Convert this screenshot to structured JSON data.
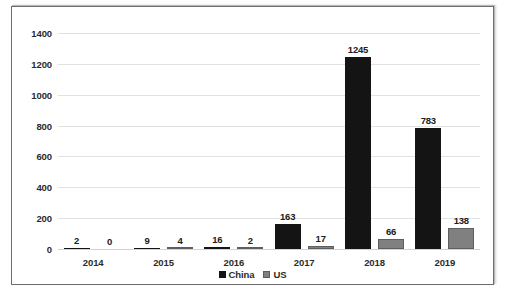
{
  "chart_data": {
    "type": "bar",
    "title": "",
    "subtitle": "",
    "xlabel": "",
    "ylabel": "",
    "categories": [
      "2014",
      "2015",
      "2016",
      "2017",
      "2018",
      "2019"
    ],
    "series": [
      {
        "name": "China",
        "color": "#141414",
        "values": [
          2,
          9,
          16,
          163,
          1245,
          783
        ]
      },
      {
        "name": "US",
        "color": "#808080",
        "values": [
          0,
          4,
          2,
          17,
          66,
          138
        ]
      }
    ],
    "ylim": [
      0,
      1400
    ],
    "ytick_values": [
      0,
      200,
      400,
      600,
      800,
      1000,
      1200,
      1400
    ],
    "ytick_labels": [
      "0",
      "200",
      "400",
      "600",
      "800",
      "1000",
      "1200",
      "1400"
    ],
    "grid": "horizontal",
    "legend_position": "bottom-center",
    "data_labels": true
  },
  "legend": {
    "items": [
      {
        "label": "China"
      },
      {
        "label": "US"
      }
    ]
  }
}
